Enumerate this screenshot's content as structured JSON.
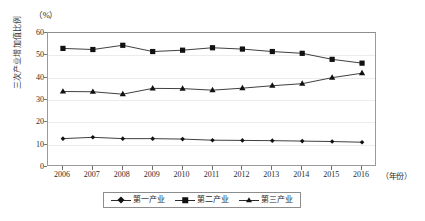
{
  "chart_data": {
    "type": "line",
    "title": "",
    "subtitle": "",
    "xlabel": "（年份）",
    "ylabel": "三次产业增加值比例",
    "y_unit": "（%）",
    "categories": [
      "2006",
      "2007",
      "2008",
      "2009",
      "2010",
      "2011",
      "2012",
      "2013",
      "2014",
      "2015",
      "2016"
    ],
    "x": [
      2006,
      2007,
      2008,
      2009,
      2010,
      2011,
      2012,
      2013,
      2014,
      2015,
      2016
    ],
    "ylim": [
      0,
      60
    ],
    "yticks": [
      0,
      10,
      20,
      30,
      40,
      50,
      60
    ],
    "ytick_labels": [
      "0",
      "10",
      "20",
      "30",
      "40",
      "50",
      "60"
    ],
    "grid": true,
    "legend_position": "bottom",
    "series": [
      {
        "name": "第一产业",
        "marker": "diamond",
        "values": [
          12.7,
          13.3,
          12.7,
          12.7,
          12.5,
          12.0,
          11.9,
          11.8,
          11.6,
          11.4,
          11.1
        ]
      },
      {
        "name": "第二产业",
        "marker": "square",
        "values": [
          53.1,
          52.6,
          54.5,
          51.7,
          52.3,
          53.4,
          52.8,
          51.7,
          50.9,
          48.2,
          46.5
        ]
      },
      {
        "name": "第三产业",
        "marker": "triangle",
        "values": [
          33.8,
          33.7,
          32.6,
          35.2,
          35.1,
          34.4,
          35.3,
          36.4,
          37.3,
          40.0,
          42.0
        ]
      }
    ],
    "colors": {
      "line": "#2a2a2a",
      "marker": "#111111",
      "grid": "#ececec",
      "frame": "#9a9a9a"
    }
  }
}
